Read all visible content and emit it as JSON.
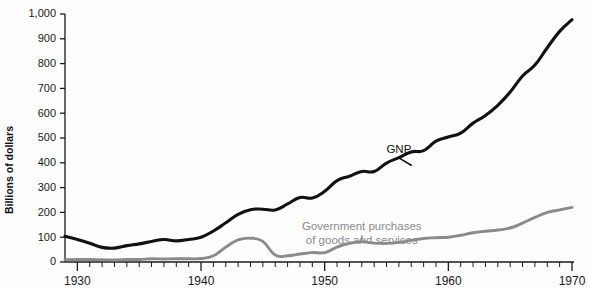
{
  "chart_data": {
    "type": "line",
    "title": "",
    "xlabel": "",
    "ylabel": "Billions of dollars",
    "xlim": [
      1929,
      1970
    ],
    "ylim": [
      0,
      1000
    ],
    "grid": false,
    "legend_position": "inline-annotations",
    "y_ticks": [
      "0",
      "100",
      "200",
      "300",
      "400",
      "500",
      "600",
      "700",
      "800",
      "900",
      "1,000"
    ],
    "y_tick_values": [
      0,
      100,
      200,
      300,
      400,
      500,
      600,
      700,
      800,
      900,
      1000
    ],
    "x_ticks": [
      "1930",
      "1940",
      "1950",
      "1960",
      "1970"
    ],
    "x_tick_values": [
      1930,
      1940,
      1950,
      1960,
      1970
    ],
    "x_minor_tick_interval": 1,
    "colors": {
      "gnp": "#111111",
      "government": "#8a8a8a",
      "axis": "#1a1a1a",
      "background": "#fdfdfd"
    },
    "x": [
      1929,
      1930,
      1931,
      1932,
      1933,
      1934,
      1935,
      1936,
      1937,
      1938,
      1939,
      1940,
      1941,
      1942,
      1943,
      1944,
      1945,
      1946,
      1947,
      1948,
      1949,
      1950,
      1951,
      1952,
      1953,
      1954,
      1955,
      1956,
      1957,
      1958,
      1959,
      1960,
      1961,
      1962,
      1963,
      1964,
      1965,
      1966,
      1967,
      1968,
      1969,
      1970
    ],
    "series": [
      {
        "name": "GNP",
        "color": "#111111",
        "label": "GNP",
        "label_x": 1956,
        "label_y": 440,
        "values": [
          104,
          91,
          76,
          59,
          56,
          66,
          73,
          83,
          91,
          85,
          91,
          100,
          125,
          158,
          192,
          211,
          213,
          210,
          234,
          260,
          258,
          285,
          328,
          346,
          365,
          365,
          399,
          421,
          444,
          449,
          487,
          504,
          520,
          560,
          591,
          632,
          685,
          750,
          794,
          864,
          930,
          977
        ]
      },
      {
        "name": "Government purchases of goods and services",
        "color": "#8a8a8a",
        "label": "Government purchases of goods and services",
        "label_line1": "Government purchases",
        "label_line2": "of goods and services",
        "label_x": 1953,
        "label_y": 128,
        "values": [
          9,
          10,
          10,
          9,
          8,
          10,
          10,
          13,
          12,
          13,
          13,
          14,
          25,
          60,
          89,
          96,
          83,
          28,
          25,
          32,
          38,
          38,
          60,
          75,
          82,
          76,
          75,
          79,
          87,
          95,
          98,
          100,
          108,
          118,
          124,
          129,
          137,
          157,
          180,
          200,
          210,
          220
        ]
      }
    ],
    "annotations": [
      {
        "name": "gnp-pointer",
        "from_x": 1956,
        "from_y": 420,
        "to_x": 1957,
        "to_y": 390
      },
      {
        "name": "government-pointer",
        "from_x": 1953,
        "from_y": 105,
        "to_x": 1953,
        "to_y": 88
      }
    ]
  }
}
